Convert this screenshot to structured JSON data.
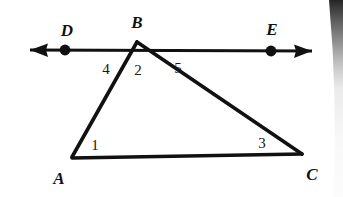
{
  "figure": {
    "kind": "geometry-diagram",
    "width": 343,
    "height": 197,
    "background_color": "#ffffff",
    "stroke_color": "#111111"
  },
  "points": [
    {
      "id": "A",
      "label": "A",
      "x": 72,
      "y": 157,
      "label_x": 59,
      "label_y": 178,
      "dot": false
    },
    {
      "id": "B",
      "label": "B",
      "x": 137,
      "y": 42,
      "label_x": 137,
      "label_y": 22,
      "dot": false
    },
    {
      "id": "C",
      "label": "C",
      "x": 302,
      "y": 154,
      "label_x": 312,
      "label_y": 174,
      "dot": false
    },
    {
      "id": "D",
      "label": "D",
      "x": 65,
      "y": 50,
      "label_x": 67,
      "label_y": 30,
      "dot": true
    },
    {
      "id": "E",
      "label": "E",
      "x": 271,
      "y": 51,
      "label_x": 272,
      "label_y": 29,
      "dot": true
    }
  ],
  "segments": [
    {
      "id": "AB",
      "from": "A",
      "to": "B",
      "label": "side AB"
    },
    {
      "id": "BC",
      "from": "B",
      "to": "C",
      "label": "side BC"
    },
    {
      "id": "AC",
      "from": "A",
      "to": "C",
      "label": "side AC"
    }
  ],
  "line": {
    "id": "DE",
    "label": "line DE",
    "through": [
      "D",
      "B",
      "E"
    ],
    "left_end_x": 30,
    "left_end_y": 50,
    "right_end_x": 312,
    "right_end_y": 51,
    "double_headed": true
  },
  "angle_labels": [
    {
      "id": "angle-1",
      "label": "1",
      "x": 95,
      "y": 145,
      "at_vertex": "A"
    },
    {
      "id": "angle-2",
      "label": "2",
      "x": 138,
      "y": 70,
      "at_vertex": "B"
    },
    {
      "id": "angle-3",
      "label": "3",
      "x": 262,
      "y": 143,
      "at_vertex": "C"
    },
    {
      "id": "angle-4",
      "label": "4",
      "x": 106,
      "y": 69,
      "at_vertex": "B"
    },
    {
      "id": "angle-5",
      "label": "5",
      "x": 178,
      "y": 68,
      "at_vertex": "B"
    }
  ]
}
